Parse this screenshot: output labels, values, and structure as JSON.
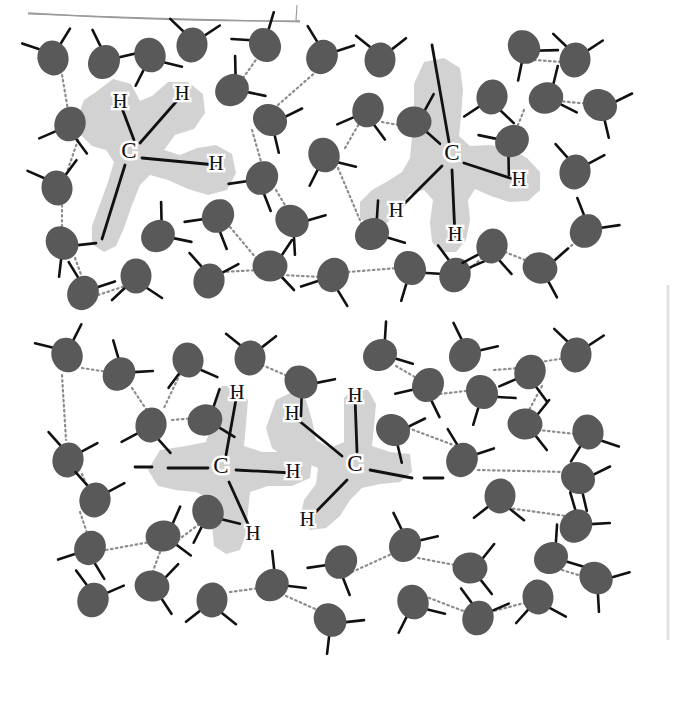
{
  "figure": {
    "background_color": "#ffffff",
    "panel_count": 2,
    "artifact_lines": [
      {
        "name": "top-scan-edge",
        "color": "#9a9a9a"
      },
      {
        "name": "right-scan-edge",
        "color": "#e2e2e2"
      }
    ]
  },
  "legend": {
    "water_molecule_color": "#595959",
    "covalent_bond_color": "#111111",
    "hydrogen_bond_color": "#8c8c8c",
    "solute_cloud_color": "#d2d2d2",
    "label_color": "#111111"
  },
  "panels": [
    {
      "id": "top-panel",
      "name": "methane-in-water-panel",
      "description": "Two separate methane molecules dissolved in a hydrogen-bonded water network",
      "solutes": [
        {
          "id": "methane-left",
          "name": "methane-molecule-left",
          "carbon_label": "C",
          "hydrogen_labels": [
            "H",
            "H",
            "H"
          ],
          "carbon_center": {
            "x": 129,
            "y": 153
          },
          "hydrogens": [
            {
              "label": "H",
              "x": 120,
              "y": 103,
              "bond_to": {
                "x": 134,
                "y": 140
              }
            },
            {
              "label": "H",
              "x": 182,
              "y": 95,
              "bond_to": {
                "x": 140,
                "y": 143
              }
            },
            {
              "label": "H",
              "x": 216,
              "y": 165,
              "bond_to": {
                "x": 142,
                "y": 158
              }
            },
            {
              "label": "",
              "x": 102,
              "y": 239,
              "bond_to": {
                "x": 125,
                "y": 165
              }
            }
          ],
          "cloud_points": "96,92 113,79 131,84 140,101 152,96 168,82 188,82 203,94 205,113 194,129 175,135 164,150 180,155 197,148 216,145 232,154 236,173 227,190 208,195 188,189 168,180 150,175 140,185 132,205 124,228 116,246 104,252 92,244 92,226 100,204 108,182 114,162 106,150 92,146 80,134 78,116 84,100"
        },
        {
          "id": "methane-right",
          "name": "methane-molecule-right",
          "carbon_label": "C",
          "hydrogen_labels": [
            "H",
            "H",
            "H"
          ],
          "carbon_center": {
            "x": 452,
            "y": 155
          },
          "hydrogens": [
            {
              "label": "",
              "x": 432,
              "y": 45,
              "bond_to": {
                "x": 449,
                "y": 142
              }
            },
            {
              "label": "H",
              "x": 519,
              "y": 181,
              "bond_to": {
                "x": 464,
                "y": 163
              }
            },
            {
              "label": "H",
              "x": 396,
              "y": 212,
              "bond_to": {
                "x": 442,
                "y": 166
              }
            },
            {
              "label": "H",
              "x": 455,
              "y": 236,
              "bond_to": {
                "x": 452,
                "y": 170
              }
            }
          ],
          "cloud_points": "424,62 444,58 460,68 463,90 461,116 459,136 470,146 489,145 509,148 527,158 540,172 540,190 528,201 509,202 491,196 475,189 468,200 470,220 466,240 456,252 442,252 432,242 430,222 433,200 424,190 410,194 398,210 386,224 371,227 360,218 360,202 372,190 388,181 402,172 410,158 412,136 414,110 414,84"
        }
      ],
      "water_molecules": [
        {
          "x": 53,
          "y": 58,
          "rot": -15
        },
        {
          "x": 104,
          "y": 62,
          "rot": 30
        },
        {
          "x": 150,
          "y": 55,
          "rot": 160
        },
        {
          "x": 192,
          "y": 45,
          "rot": 10
        },
        {
          "x": 70,
          "y": 124,
          "rot": 200
        },
        {
          "x": 265,
          "y": 45,
          "rot": -30
        },
        {
          "x": 232,
          "y": 90,
          "rot": 55
        },
        {
          "x": 270,
          "y": 120,
          "rot": 120
        },
        {
          "x": 322,
          "y": 57,
          "rot": 25
        },
        {
          "x": 380,
          "y": 60,
          "rot": 5
        },
        {
          "x": 368,
          "y": 110,
          "rot": 200
        },
        {
          "x": 414,
          "y": 122,
          "rot": 85
        },
        {
          "x": 324,
          "y": 155,
          "rot": 160
        },
        {
          "x": 262,
          "y": 178,
          "rot": 215
        },
        {
          "x": 57,
          "y": 188,
          "rot": -10
        },
        {
          "x": 62,
          "y": 243,
          "rot": 140
        },
        {
          "x": 83,
          "y": 293,
          "rot": 25
        },
        {
          "x": 136,
          "y": 276,
          "rot": 180
        },
        {
          "x": 158,
          "y": 236,
          "rot": 55
        },
        {
          "x": 218,
          "y": 216,
          "rot": 215
        },
        {
          "x": 209,
          "y": 281,
          "rot": 15
        },
        {
          "x": 270,
          "y": 266,
          "rot": 90
        },
        {
          "x": 292,
          "y": 221,
          "rot": 130
        },
        {
          "x": 333,
          "y": 275,
          "rot": 205
        },
        {
          "x": 372,
          "y": 234,
          "rot": 60
        },
        {
          "x": 410,
          "y": 268,
          "rot": 150
        },
        {
          "x": 455,
          "y": 275,
          "rot": 20
        },
        {
          "x": 492,
          "y": 246,
          "rot": 195
        },
        {
          "x": 540,
          "y": 268,
          "rot": 105
        },
        {
          "x": 586,
          "y": 231,
          "rot": 35
        },
        {
          "x": 524,
          "y": 47,
          "rot": 145
        },
        {
          "x": 575,
          "y": 60,
          "rot": 10
        },
        {
          "x": 492,
          "y": 97,
          "rot": 190
        },
        {
          "x": 546,
          "y": 98,
          "rot": 70
        },
        {
          "x": 512,
          "y": 141,
          "rot": 235
        },
        {
          "x": 600,
          "y": 105,
          "rot": 120
        },
        {
          "x": 575,
          "y": 172,
          "rot": 15
        }
      ],
      "hydrogen_bonds": [
        {
          "x1": 120,
          "y1": 57,
          "x2": 140,
          "y2": 52
        },
        {
          "x1": 62,
          "y1": 75,
          "x2": 68,
          "y2": 110
        },
        {
          "x1": 78,
          "y1": 140,
          "x2": 66,
          "y2": 175
        },
        {
          "x1": 62,
          "y1": 205,
          "x2": 62,
          "y2": 230
        },
        {
          "x1": 75,
          "y1": 258,
          "x2": 83,
          "y2": 280
        },
        {
          "x1": 98,
          "y1": 295,
          "x2": 128,
          "y2": 285
        },
        {
          "x1": 243,
          "y1": 78,
          "x2": 258,
          "y2": 57
        },
        {
          "x1": 278,
          "y1": 105,
          "x2": 318,
          "y2": 70
        },
        {
          "x1": 252,
          "y1": 130,
          "x2": 262,
          "y2": 165
        },
        {
          "x1": 276,
          "y1": 190,
          "x2": 288,
          "y2": 210
        },
        {
          "x1": 230,
          "y1": 227,
          "x2": 256,
          "y2": 258
        },
        {
          "x1": 222,
          "y1": 272,
          "x2": 258,
          "y2": 270
        },
        {
          "x1": 282,
          "y1": 275,
          "x2": 322,
          "y2": 277
        },
        {
          "x1": 348,
          "y1": 272,
          "x2": 398,
          "y2": 268
        },
        {
          "x1": 345,
          "y1": 148,
          "x2": 360,
          "y2": 122
        },
        {
          "x1": 338,
          "y1": 168,
          "x2": 362,
          "y2": 225
        },
        {
          "x1": 382,
          "y1": 122,
          "x2": 404,
          "y2": 126
        },
        {
          "x1": 466,
          "y1": 272,
          "x2": 482,
          "y2": 258
        },
        {
          "x1": 505,
          "y1": 252,
          "x2": 530,
          "y2": 262
        },
        {
          "x1": 552,
          "y1": 262,
          "x2": 578,
          "y2": 240
        },
        {
          "x1": 524,
          "y1": 110,
          "x2": 516,
          "y2": 130
        },
        {
          "x1": 558,
          "y1": 101,
          "x2": 590,
          "y2": 104
        },
        {
          "x1": 534,
          "y1": 60,
          "x2": 562,
          "y2": 62
        }
      ]
    },
    {
      "id": "bottom-panel",
      "name": "hydrocarbon-chain-in-water-panel",
      "description": "A two-carbon hydrocarbon segment of a longer chain dissolved in water",
      "solutes": [
        {
          "id": "chain-carbon-left",
          "name": "chain-carbon-left",
          "carbon_label": "C",
          "hydrogen_labels": [
            "H",
            "H",
            "H"
          ],
          "carbon_center": {
            "x": 221,
            "y": 468
          },
          "chain_dash": {
            "x1": 135,
            "y1": 467,
            "x2": 152,
            "y2": 467
          },
          "hydrogens": [
            {
              "label": "H",
              "x": 237,
              "y": 394,
              "bond_to": {
                "x": 226,
                "y": 455
              }
            },
            {
              "label": "H",
              "x": 293,
              "y": 473,
              "bond_to": {
                "x": 236,
                "y": 470
              }
            },
            {
              "label": "H",
              "x": 253,
              "y": 535,
              "bond_to": {
                "x": 229,
                "y": 482
              }
            },
            {
              "label": "",
              "x": 168,
              "y": 468,
              "bond_to": {
                "x": 208,
                "y": 468
              }
            }
          ],
          "cloud_points": "160,450 186,446 206,442 212,424 214,400 222,386 238,386 248,400 246,424 244,446 262,452 284,452 304,452 312,462 310,478 292,486 268,486 250,492 248,512 246,534 240,550 226,554 214,546 212,524 212,500 196,492 176,490 158,486 148,470"
        },
        {
          "id": "chain-carbon-right",
          "name": "chain-carbon-right",
          "carbon_label": "C",
          "hydrogen_labels": [
            "H",
            "H",
            "H"
          ],
          "carbon_center": {
            "x": 355,
            "y": 466
          },
          "chain_dash": {
            "x1": 424,
            "y1": 478,
            "x2": 443,
            "y2": 478
          },
          "hydrogens": [
            {
              "label": "H",
              "x": 292,
              "y": 415,
              "bond_to": {
                "x": 342,
                "y": 456
              }
            },
            {
              "label": "H",
              "x": 355,
              "y": 397,
              "bond_to": {
                "x": 357,
                "y": 452
              }
            },
            {
              "label": "H",
              "x": 307,
              "y": 521,
              "bond_to": {
                "x": 347,
                "y": 480
              }
            },
            {
              "label": "",
              "x": 412,
              "y": 478,
              "bond_to": {
                "x": 370,
                "y": 470
              }
            }
          ],
          "cloud_points": "276,400 292,392 306,400 312,420 316,440 330,448 344,442 344,420 344,398 354,388 368,390 376,404 374,426 372,446 390,452 410,454 412,472 400,482 380,484 362,488 350,500 340,516 326,528 310,530 300,518 304,500 316,484 318,468 304,462 286,458 272,448 266,428"
        }
      ],
      "water_molecules": [
        {
          "x": 67,
          "y": 355,
          "rot": -20
        },
        {
          "x": 119,
          "y": 374,
          "rot": 40
        },
        {
          "x": 188,
          "y": 360,
          "rot": 170
        },
        {
          "x": 250,
          "y": 358,
          "rot": 5
        },
        {
          "x": 301,
          "y": 382,
          "rot": 135
        },
        {
          "x": 151,
          "y": 425,
          "rot": 195
        },
        {
          "x": 205,
          "y": 420,
          "rot": 75
        },
        {
          "x": 68,
          "y": 460,
          "rot": 15
        },
        {
          "x": 380,
          "y": 355,
          "rot": 60
        },
        {
          "x": 428,
          "y": 385,
          "rot": 210
        },
        {
          "x": 393,
          "y": 430,
          "rot": 120
        },
        {
          "x": 465,
          "y": 355,
          "rot": 30
        },
        {
          "x": 482,
          "y": 392,
          "rot": 150
        },
        {
          "x": 530,
          "y": 372,
          "rot": 200
        },
        {
          "x": 576,
          "y": 355,
          "rot": 10
        },
        {
          "x": 525,
          "y": 424,
          "rot": 95
        },
        {
          "x": 588,
          "y": 432,
          "rot": 165
        },
        {
          "x": 462,
          "y": 460,
          "rot": 25
        },
        {
          "x": 500,
          "y": 496,
          "rot": 185
        },
        {
          "x": 578,
          "y": 478,
          "rot": 120
        },
        {
          "x": 576,
          "y": 526,
          "rot": 40
        },
        {
          "x": 90,
          "y": 548,
          "rot": 205
        },
        {
          "x": 163,
          "y": 536,
          "rot": 80
        },
        {
          "x": 95,
          "y": 500,
          "rot": 15
        },
        {
          "x": 208,
          "y": 512,
          "rot": 160
        },
        {
          "x": 152,
          "y": 586,
          "rot": 100
        },
        {
          "x": 93,
          "y": 600,
          "rot": 20
        },
        {
          "x": 212,
          "y": 600,
          "rot": 185
        },
        {
          "x": 272,
          "y": 585,
          "rot": 50
        },
        {
          "x": 330,
          "y": 620,
          "rot": 140
        },
        {
          "x": 341,
          "y": 562,
          "rot": 215
        },
        {
          "x": 405,
          "y": 545,
          "rot": 30
        },
        {
          "x": 413,
          "y": 602,
          "rot": 160
        },
        {
          "x": 470,
          "y": 568,
          "rot": 95
        },
        {
          "x": 478,
          "y": 618,
          "rot": 20
        },
        {
          "x": 538,
          "y": 597,
          "rot": 175
        },
        {
          "x": 551,
          "y": 558,
          "rot": 60
        },
        {
          "x": 596,
          "y": 578,
          "rot": 130
        }
      ],
      "hydrogen_bonds": [
        {
          "x1": 82,
          "y1": 368,
          "x2": 108,
          "y2": 372
        },
        {
          "x1": 132,
          "y1": 388,
          "x2": 148,
          "y2": 412
        },
        {
          "x1": 172,
          "y1": 420,
          "x2": 196,
          "y2": 418
        },
        {
          "x1": 180,
          "y1": 374,
          "x2": 163,
          "y2": 410
        },
        {
          "x1": 62,
          "y1": 375,
          "x2": 66,
          "y2": 440
        },
        {
          "x1": 82,
          "y1": 474,
          "x2": 88,
          "y2": 488
        },
        {
          "x1": 80,
          "y1": 512,
          "x2": 88,
          "y2": 536
        },
        {
          "x1": 106,
          "y1": 550,
          "x2": 150,
          "y2": 542
        },
        {
          "x1": 178,
          "y1": 540,
          "x2": 202,
          "y2": 522
        },
        {
          "x1": 160,
          "y1": 552,
          "x2": 152,
          "y2": 574
        },
        {
          "x1": 262,
          "y1": 365,
          "x2": 292,
          "y2": 378
        },
        {
          "x1": 396,
          "y1": 366,
          "x2": 420,
          "y2": 380
        },
        {
          "x1": 440,
          "y1": 394,
          "x2": 474,
          "y2": 390
        },
        {
          "x1": 408,
          "y1": 428,
          "x2": 472,
          "y2": 452
        },
        {
          "x1": 494,
          "y1": 370,
          "x2": 520,
          "y2": 368
        },
        {
          "x1": 540,
          "y1": 362,
          "x2": 566,
          "y2": 358
        },
        {
          "x1": 542,
          "y1": 386,
          "x2": 528,
          "y2": 412
        },
        {
          "x1": 538,
          "y1": 430,
          "x2": 576,
          "y2": 434
        },
        {
          "x1": 478,
          "y1": 470,
          "x2": 566,
          "y2": 472
        },
        {
          "x1": 508,
          "y1": 508,
          "x2": 566,
          "y2": 516
        },
        {
          "x1": 286,
          "y1": 596,
          "x2": 322,
          "y2": 612
        },
        {
          "x1": 352,
          "y1": 572,
          "x2": 396,
          "y2": 552
        },
        {
          "x1": 418,
          "y1": 558,
          "x2": 460,
          "y2": 566
        },
        {
          "x1": 424,
          "y1": 596,
          "x2": 466,
          "y2": 612
        },
        {
          "x1": 490,
          "y1": 612,
          "x2": 528,
          "y2": 602
        },
        {
          "x1": 562,
          "y1": 570,
          "x2": 588,
          "y2": 578
        },
        {
          "x1": 230,
          "y1": 592,
          "x2": 260,
          "y2": 588
        }
      ]
    }
  ]
}
